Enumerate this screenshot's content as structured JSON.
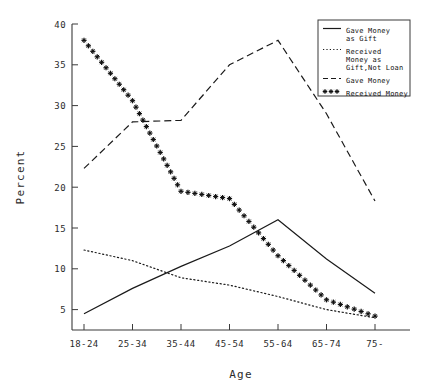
{
  "chart_data": {
    "type": "line",
    "title": "",
    "xlabel": "Age",
    "ylabel": "Percent",
    "categories": [
      "18-24",
      "25-34",
      "35-44",
      "45-54",
      "55-64",
      "65-74",
      "75-"
    ],
    "ylim": [
      2.5,
      40
    ],
    "yticks": [
      5,
      10,
      15,
      20,
      25,
      30,
      35,
      40
    ],
    "grid": false,
    "legend_position": "top-right",
    "series": [
      {
        "name": "Gave Money as Gift",
        "style": "solid",
        "values": [
          4.5,
          7.6,
          10.3,
          12.8,
          16.0,
          11.2,
          7.0
        ]
      },
      {
        "name": "Received Money as Gift, Not Loan",
        "style": "dotted",
        "values": [
          12.3,
          11.0,
          8.9,
          8.0,
          6.6,
          5.0,
          4.0
        ]
      },
      {
        "name": "Gave Money",
        "style": "dashed",
        "values": [
          22.3,
          28.0,
          28.2,
          35.0,
          38.0,
          29.0,
          18.3
        ]
      },
      {
        "name": "Received Money",
        "style": "stars",
        "values": [
          38.0,
          30.6,
          19.5,
          18.6,
          11.6,
          6.2,
          4.2
        ]
      }
    ]
  },
  "legend": {
    "entries": [
      {
        "label_lines": [
          "Gave Money",
          "as Gift"
        ],
        "style": "solid"
      },
      {
        "label_lines": [
          "Received",
          "Money as",
          "Gift,Not Loan"
        ],
        "style": "dotted"
      },
      {
        "label_lines": [
          "Gave Money"
        ],
        "style": "dashed"
      },
      {
        "label_lines": [
          "Received Money"
        ],
        "style": "stars"
      }
    ]
  },
  "colors": {
    "ink": "#1a1a1a",
    "axis": "#3a3a3a",
    "background": "#ffffff"
  }
}
